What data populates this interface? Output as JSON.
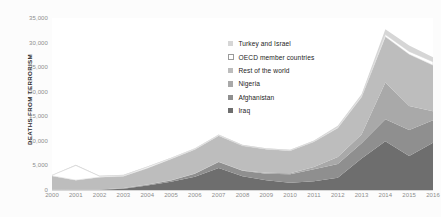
{
  "chart_data": {
    "type": "area",
    "stacked": true,
    "title": "",
    "xlabel": "",
    "ylabel": "DEATHS FROM TERRORISM",
    "ylim": [
      0,
      35000
    ],
    "yticks": [
      0,
      5000,
      10000,
      15000,
      20000,
      25000,
      30000,
      35000
    ],
    "ytick_labels": [
      "0",
      "5,000",
      "10,000",
      "15,000",
      "20,000",
      "25,000",
      "30,000",
      "35,000"
    ],
    "grid": false,
    "legend_position": "inside-top-right",
    "categories": [
      2000,
      2001,
      2002,
      2003,
      2004,
      2005,
      2006,
      2007,
      2008,
      2009,
      2010,
      2011,
      2012,
      2013,
      2014,
      2015,
      2016
    ],
    "xtick_labels": [
      "2000",
      "2001",
      "2002",
      "2003",
      "2004",
      "2005",
      "2006",
      "2007",
      "2008",
      "2009",
      "2010",
      "2011",
      "2012",
      "2013",
      "2014",
      "2015",
      "2016"
    ],
    "stack_order_bottom_to_top": [
      "Iraq",
      "Afghanistan",
      "Nigeria",
      "Rest of the world",
      "OECD member countries",
      "Turkey and Israel"
    ],
    "series": [
      {
        "name": "Iraq",
        "color": "#6e6e6e",
        "values": [
          30,
          50,
          40,
          250,
          900,
          1700,
          2700,
          4500,
          2800,
          2000,
          1500,
          1800,
          2500,
          6400,
          9900,
          6900,
          9600
        ]
      },
      {
        "name": "Afghanistan",
        "color": "#8f8f8f",
        "values": [
          20,
          30,
          40,
          100,
          150,
          250,
          600,
          1200,
          1100,
          1300,
          1700,
          2400,
          2800,
          3100,
          4500,
          5300,
          4600
        ]
      },
      {
        "name": "Nigeria",
        "color": "#a9a9a9",
        "values": [
          20,
          20,
          30,
          40,
          60,
          40,
          50,
          60,
          80,
          200,
          200,
          500,
          1400,
          1800,
          7500,
          4900,
          1800
        ]
      },
      {
        "name": "Rest of the world",
        "color": "#bdbdbd",
        "values": [
          2800,
          1900,
          2500,
          2400,
          3300,
          4300,
          4900,
          5300,
          5000,
          4800,
          4600,
          5100,
          5900,
          7600,
          9300,
          10500,
          9400
        ]
      },
      {
        "name": "OECD member countries",
        "color": "#ffffff",
        "values": [
          120,
          3000,
          200,
          150,
          260,
          170,
          120,
          110,
          90,
          80,
          90,
          120,
          180,
          220,
          420,
          600,
          700
        ]
      },
      {
        "name": "Turkey and Israel",
        "color": "#d6d6d6",
        "values": [
          80,
          120,
          100,
          150,
          120,
          110,
          130,
          140,
          120,
          100,
          110,
          150,
          300,
          350,
          1100,
          1200,
          900
        ]
      }
    ],
    "legend_entries": [
      {
        "label": "Turkey and Israel",
        "color": "#d6d6d6",
        "border": ""
      },
      {
        "label": "OECD member countries",
        "color": "#ffffff",
        "border": "#9a9a9a"
      },
      {
        "label": "Rest of the world",
        "color": "#bdbdbd",
        "border": ""
      },
      {
        "label": "Nigeria",
        "color": "#a9a9a9",
        "border": ""
      },
      {
        "label": "Afghanistan",
        "color": "#8f8f8f",
        "border": ""
      },
      {
        "label": "Iraq",
        "color": "#6e6e6e",
        "border": ""
      }
    ]
  }
}
